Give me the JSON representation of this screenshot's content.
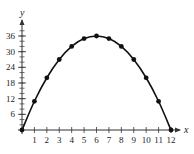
{
  "chart_data": {
    "type": "line",
    "title": "",
    "xlabel": "x",
    "ylabel": "y",
    "x": [
      0,
      1,
      2,
      3,
      4,
      5,
      6,
      7,
      8,
      9,
      10,
      11,
      12
    ],
    "series": [
      {
        "name": "y",
        "values": [
          0,
          11,
          20,
          27,
          32,
          35,
          36,
          35,
          32,
          27,
          20,
          11,
          0
        ],
        "markers": true,
        "color": "#111111"
      }
    ],
    "x_ticks": [
      "1",
      "2",
      "3",
      "4",
      "5",
      "6",
      "7",
      "8",
      "9",
      "10",
      "11",
      "12"
    ],
    "y_ticks": [
      "6",
      "12",
      "18",
      "24",
      "30",
      "36"
    ],
    "y_minor_step": 2,
    "xlim": [
      0,
      12
    ],
    "ylim": [
      0,
      36
    ],
    "grid": false,
    "legend": null
  }
}
